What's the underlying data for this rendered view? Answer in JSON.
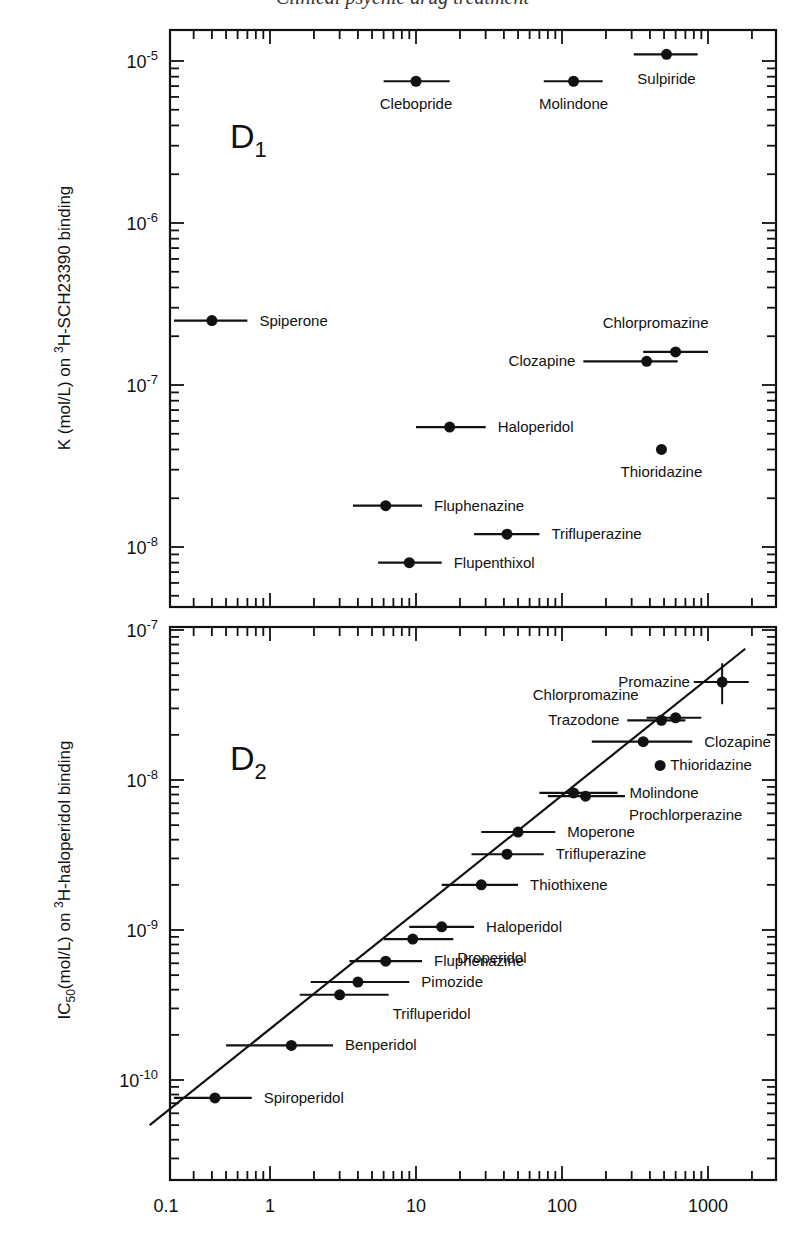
{
  "header": {
    "caption": "Clinical psychic drug treatment"
  },
  "chart_data": [
    {
      "type": "scatter",
      "panel_label": "D",
      "panel_subscript": "1",
      "title": "",
      "xlabel": "",
      "ylabel": "K (mol/L) on 3H-SCH23390 binding",
      "ylabel_parts": {
        "pre": "K (mol/L) on ",
        "sup": "3",
        "post": "H-SCH23390 binding"
      },
      "xscale": "log",
      "yscale": "log",
      "xlim": [
        0.15,
        3000
      ],
      "ylim": [
        4.5e-09,
        1.4e-05
      ],
      "y_tick_labels": [
        {
          "base": "10",
          "exp": "-5",
          "value": 1e-05
        },
        {
          "base": "10",
          "exp": "-6",
          "value": 1e-06
        },
        {
          "base": "10",
          "exp": "-7",
          "value": 1e-07
        },
        {
          "base": "10",
          "exp": "-8",
          "value": 1e-08
        }
      ],
      "grid": false,
      "points": [
        {
          "name": "Clebopride",
          "x": 10,
          "y": 7.5e-06,
          "xerr": [
            6,
            17
          ],
          "label_pos": "below"
        },
        {
          "name": "Molindone",
          "x": 120,
          "y": 7.5e-06,
          "xerr": [
            75,
            190
          ],
          "label_pos": "below"
        },
        {
          "name": "Sulpiride",
          "x": 520,
          "y": 1.1e-05,
          "xerr": [
            310,
            850
          ],
          "label_pos": "below"
        },
        {
          "name": "Spiperone",
          "x": 0.4,
          "y": 2.5e-07,
          "xerr": [
            0.22,
            0.7
          ],
          "label_pos": "right"
        },
        {
          "name": "Chlorpromazine",
          "x": 600,
          "y": 1.6e-07,
          "xerr": [
            360,
            1000
          ],
          "label_pos": "above"
        },
        {
          "name": "Clozapine",
          "x": 380,
          "y": 1.4e-07,
          "xerr": [
            140,
            620
          ],
          "label_pos": "left"
        },
        {
          "name": "Haloperidol",
          "x": 17,
          "y": 5.5e-08,
          "xerr": [
            10,
            30
          ],
          "label_pos": "right"
        },
        {
          "name": "Thioridazine",
          "x": 480,
          "y": 4e-08,
          "xerr": null,
          "label_pos": "below"
        },
        {
          "name": "Fluphenazine",
          "x": 6.2,
          "y": 1.8e-08,
          "xerr": [
            3.7,
            11
          ],
          "label_pos": "right"
        },
        {
          "name": "Trifluperazine",
          "x": 42,
          "y": 1.2e-08,
          "xerr": [
            25,
            70
          ],
          "label_pos": "right"
        },
        {
          "name": "Flupenthixol",
          "x": 9,
          "y": 8e-09,
          "xerr": [
            5.5,
            15
          ],
          "label_pos": "right"
        }
      ]
    },
    {
      "type": "scatter",
      "panel_label": "D",
      "panel_subscript": "2",
      "title": "",
      "xlabel": "",
      "ylabel": "IC50(mol/L) on 3H-haloperidol binding",
      "ylabel_parts": {
        "pre": "IC",
        "sub": "50",
        "mid": "(mol/L) on ",
        "sup": "3",
        "post": "H-haloperidol binding"
      },
      "xscale": "log",
      "yscale": "log",
      "xlim": [
        0.15,
        3000
      ],
      "ylim": [
        3.5e-11,
        1e-07
      ],
      "x_tick_labels": [
        "0.1",
        "1",
        "10",
        "100",
        "1000"
      ],
      "y_tick_labels": [
        {
          "base": "10",
          "exp": "-7",
          "value": 1e-07
        },
        {
          "base": "10",
          "exp": "-8",
          "value": 1e-08
        },
        {
          "base": "10",
          "exp": "-9",
          "value": 1e-09
        },
        {
          "base": "10",
          "exp": "-10",
          "value": 1e-10
        }
      ],
      "grid": false,
      "regression_line": {
        "x": [
          0.15,
          1800
        ],
        "y": [
          5e-11,
          7.5e-08
        ]
      },
      "points": [
        {
          "name": "Promazine",
          "x": 1250,
          "y": 4.5e-08,
          "xerr": [
            800,
            1900
          ],
          "yerr": [
            3.2e-08,
            6e-08
          ],
          "label_pos": "left"
        },
        {
          "name": "Chlorpromazine",
          "x": 600,
          "y": 2.6e-08,
          "xerr": [
            380,
            900
          ],
          "label_pos": "left-above"
        },
        {
          "name": "Trazodone",
          "x": 480,
          "y": 2.5e-08,
          "xerr": [
            280,
            700
          ],
          "label_pos": "left"
        },
        {
          "name": "Clozapine",
          "x": 360,
          "y": 1.8e-08,
          "xerr": [
            160,
            780
          ],
          "label_pos": "right"
        },
        {
          "name": "Thioridazine",
          "x": 470,
          "y": 1.25e-08,
          "xerr": null,
          "label_pos": "right"
        },
        {
          "name": "Molindone",
          "x": 120,
          "y": 8.2e-09,
          "xerr": [
            70,
            240
          ],
          "label_pos": "right"
        },
        {
          "name": "Prochlorperazine",
          "x": 145,
          "y": 7.8e-09,
          "xerr": [
            80,
            270
          ],
          "label_pos": "below-right"
        },
        {
          "name": "Moperone",
          "x": 50,
          "y": 4.5e-09,
          "xerr": [
            28,
            90
          ],
          "label_pos": "right"
        },
        {
          "name": "Trifluperazine",
          "x": 42,
          "y": 3.2e-09,
          "xerr": [
            24,
            75
          ],
          "label_pos": "right"
        },
        {
          "name": "Thiothixene",
          "x": 28,
          "y": 2e-09,
          "xerr": [
            15,
            50
          ],
          "label_pos": "right"
        },
        {
          "name": "Haloperidol",
          "x": 15,
          "y": 1.05e-09,
          "xerr": [
            9,
            25
          ],
          "label_pos": "right"
        },
        {
          "name": "Droperidol",
          "x": 9.5,
          "y": 8.7e-10,
          "xerr": [
            6,
            18
          ],
          "label_pos": "below-right"
        },
        {
          "name": "Fluphenazine",
          "x": 6.2,
          "y": 6.2e-10,
          "xerr": [
            3.5,
            11
          ],
          "label_pos": "right"
        },
        {
          "name": "Pimozide",
          "x": 4,
          "y": 4.5e-10,
          "xerr": [
            1.9,
            9
          ],
          "label_pos": "right"
        },
        {
          "name": "Trifluperidol",
          "x": 3,
          "y": 3.7e-10,
          "xerr": [
            1.6,
            6.5
          ],
          "label_pos": "below-right"
        },
        {
          "name": "Benperidol",
          "x": 1.4,
          "y": 1.7e-10,
          "xerr": [
            0.5,
            2.7
          ],
          "label_pos": "right"
        },
        {
          "name": "Spiroperidol",
          "x": 0.42,
          "y": 7.6e-11,
          "xerr": [
            0.22,
            0.75
          ],
          "label_pos": "right"
        }
      ]
    }
  ]
}
